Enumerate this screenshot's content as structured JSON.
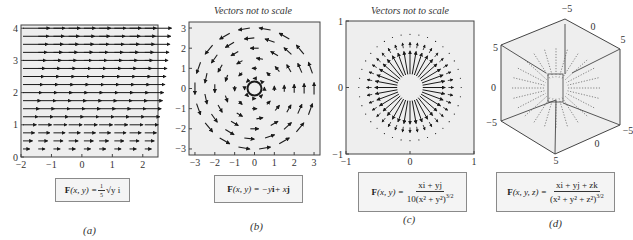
{
  "chart_data": [
    {
      "id": "a",
      "type": "quiver",
      "panel_label": "(a)",
      "caption": "",
      "formula": {
        "lhs": "F(x, y) = ",
        "rhs": "⅕√y i"
      },
      "xlim": [
        -2,
        2.5
      ],
      "ylim": [
        0,
        4.1
      ],
      "xticks": [
        "-2",
        "-1",
        "0",
        "1",
        "2"
      ],
      "yticks": [
        "0",
        "1",
        "2",
        "3",
        "4"
      ],
      "field": "0.2*sqrt(y) i",
      "grid_spacing": {
        "x": 0.5,
        "y": 0.25
      }
    },
    {
      "id": "b",
      "type": "quiver",
      "panel_label": "(b)",
      "caption": "Vectors not to scale",
      "formula": {
        "lhs": "F(x, y) = ",
        "rhs": "−y i + x j"
      },
      "xlim": [
        -3.3,
        3.3
      ],
      "ylim": [
        -3.3,
        3.3
      ],
      "xticks": [
        "-3",
        "-2",
        "-1",
        "0",
        "1",
        "2",
        "3"
      ],
      "yticks": [
        "-3",
        "-2",
        "-1",
        "0",
        "1",
        "2",
        "3"
      ],
      "field": "-y i + x j",
      "rings": [
        0.5,
        1.0,
        1.5,
        2.0,
        2.5,
        3.0
      ]
    },
    {
      "id": "c",
      "type": "quiver",
      "panel_label": "(c)",
      "caption": "Vectors not to scale",
      "formula": {
        "lhs": "F(x, y) = ",
        "num": "xi + yj",
        "den": "10(x² + y²)^3/2"
      },
      "xlim": [
        -1,
        1
      ],
      "ylim": [
        -1,
        1
      ],
      "xticks": [
        "-1",
        "0",
        "1"
      ],
      "yticks": [
        "-1",
        "0",
        "1"
      ],
      "field": "(x i + y j) / (10 (x^2+y^2)^(3/2))",
      "rays": 36
    },
    {
      "id": "d",
      "type": "quiver3d",
      "panel_label": "(d)",
      "caption": "",
      "formula": {
        "lhs": "F(x, y, z) = ",
        "num": "xi + yj + zk",
        "den": "(x² + y² + z²)^3/2"
      },
      "axis_ranges": [
        -5,
        5
      ],
      "tick_labels": {
        "top": "-5",
        "top_right_mid": "0",
        "right_upper": "5",
        "left_upper": "5",
        "left_mid": "0",
        "left_lower": "-5",
        "right_lower": "-5",
        "bottom_mid": "0",
        "bottom": "5"
      },
      "field": "(x i + y j + z k) / (x^2+y^2+z^2)^(3/2)"
    }
  ],
  "panels": {
    "a": {
      "label": "(a)",
      "formula_lhs": "F",
      "formula_args": "(x, y) = ",
      "formula_rhs": "√y i",
      "coef_num": "1",
      "coef_den": "5"
    },
    "b": {
      "label": "(b)",
      "caption": "Vectors not to scale",
      "formula_lhs": "F",
      "formula_args": "(x, y) = −y",
      "formula_i": "i",
      "formula_mid": " + x",
      "formula_j": "j"
    },
    "c": {
      "label": "(c)",
      "caption": "Vectors not to scale",
      "formula_lhs": "F",
      "formula_args": "(x, y) = ",
      "num": "xi + yj",
      "den": "10(x² + y²)",
      "den_exp": "3/2"
    },
    "d": {
      "label": "(d)",
      "formula_lhs": "F",
      "formula_args": "(x, y, z) = ",
      "num": "xi + yj + zk",
      "den": "(x² + y² + z²)",
      "den_exp": "3/2"
    }
  },
  "style": {
    "plot_bg": "#eeeeee",
    "arrow": "#1a1a1a",
    "frame": "#444444"
  }
}
